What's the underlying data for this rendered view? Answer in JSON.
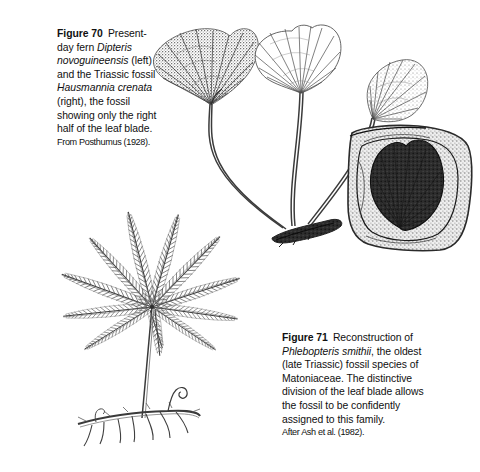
{
  "page": {
    "background_color": "#ffffff",
    "ink_color": "#101010",
    "width": 480,
    "height": 472
  },
  "figures": [
    {
      "id": "figure-70",
      "label": "Figure 70",
      "caption_parts": [
        {
          "text": "Present-day fern ",
          "style": "normal"
        },
        {
          "text": "Dipteris novoguineensis",
          "style": "italic"
        },
        {
          "text": " (left) and the Triassic fossil ",
          "style": "normal"
        },
        {
          "text": "Hausmannia crenata",
          "style": "italic"
        },
        {
          "text": " (right), the fossil showing only the right half of the leaf blade.",
          "style": "normal"
        }
      ],
      "caption_plain": "Figure 70  Present-day fern Dipteris novoguineensis (left) and the Triassic fossil Hausmannia crenata (right), the fossil showing only the right half of the leaf blade.",
      "source": "From Posthumus (1928).",
      "illustration": "three fan-shaped dipterid fern leaves on long stipes arising from a dark creeping rhizome, plus a fossil leaf impression in a rock slab"
    },
    {
      "id": "figure-71",
      "label": "Figure 71",
      "caption_parts": [
        {
          "text": "Reconstruction of ",
          "style": "normal"
        },
        {
          "text": "Phlebopteris smithii",
          "style": "italic"
        },
        {
          "text": ", the oldest (late Triassic) fossil species of Matoniaceae. The distinctive division of the leaf blade allows the fossil to be confidently assigned to this family.",
          "style": "normal"
        }
      ],
      "caption_plain": "Figure 71  Reconstruction of Phlebopteris smithii, the oldest (late Triassic) fossil species of Matoniaceae. The distinctive division of the leaf blade allows the fossil to be confidently assigned to this family.",
      "source": "After Ash et al. (1982).",
      "illustration": "palmately arranged pinnate fern frond with about ten radiating pinnae on an erect stipe rising from a horizontal rhizome bearing roots and a coiled crozier"
    }
  ],
  "artwork": {
    "dipteris_leaf_left": {
      "name": "dipteris-leaf-shaded",
      "style": "stippled dark fan blade with radiating veins"
    },
    "dipteris_leaf_middle": {
      "name": "dipteris-leaf-outline",
      "style": "open line-drawn fan blade with radiating veins"
    },
    "hausmannia_leaf_right": {
      "name": "hausmannia-half-leaf",
      "style": "small stippled fan blade, right half only"
    },
    "rhizome_upper": {
      "name": "dipteris-rhizome",
      "style": "dark horizontal creeping rhizome"
    },
    "fossil_slab": {
      "name": "fossil-rock-slab",
      "style": "speckled rock matrix enclosing a dark leaf impression"
    },
    "phlebopteris_frond": {
      "name": "phlebopteris-frond",
      "pinnae_count": 10,
      "style": "palmate arrangement of pinnate pinnae"
    },
    "phlebopteris_rhizome": {
      "name": "phlebopteris-rhizome",
      "style": "horizontal rhizome with roots and one coiled crozier"
    }
  }
}
